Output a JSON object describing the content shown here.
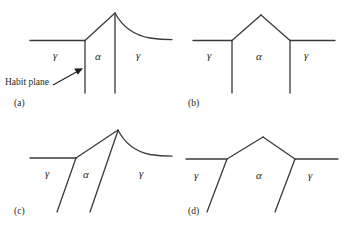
{
  "figure": {
    "background_color": "#ffffff",
    "line_color": "#3a3a3a",
    "text_color": "#231f20"
  },
  "annotations": {
    "habit_plane_label": "Habit plane"
  },
  "panels": [
    {
      "id": "a",
      "caption": "(a)",
      "labels": {
        "left_gamma": "γ",
        "alpha": "α",
        "right_gamma": "γ"
      }
    },
    {
      "id": "b",
      "caption": "(b)",
      "labels": {
        "left_gamma": "γ",
        "alpha": "α",
        "right_gamma": "γ"
      }
    },
    {
      "id": "c",
      "caption": "(c)",
      "labels": {
        "left_gamma": "γ",
        "alpha": "α",
        "right_gamma": "γ"
      }
    },
    {
      "id": "d",
      "caption": "(d)",
      "labels": {
        "left_gamma": "γ",
        "alpha": "α",
        "right_gamma": "γ"
      }
    }
  ]
}
